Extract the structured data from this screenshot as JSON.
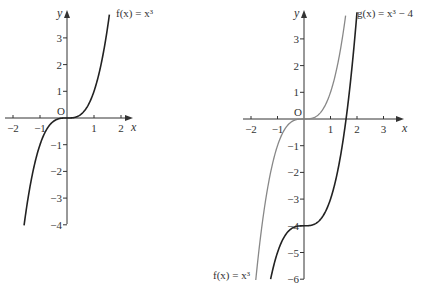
{
  "chart_data": [
    {
      "type": "line",
      "title": "",
      "xlabel": "x",
      "ylabel": "y",
      "origin_label": "O",
      "xlim": [
        -2.3,
        2.5
      ],
      "ylim": [
        -4,
        3.9
      ],
      "x_ticks": [
        -2,
        -1,
        1,
        2
      ],
      "y_ticks": [
        3,
        2,
        1,
        -1,
        -2,
        -3,
        -4
      ],
      "x_tick_labels": [
        "−2",
        "−1",
        "1",
        "2"
      ],
      "y_tick_labels": [
        "3",
        "2",
        "1",
        "−1",
        "−2",
        "−3",
        "−4"
      ],
      "series": [
        {
          "name": "f(x) = x³",
          "expression": "x^3",
          "x_range": [
            -1.59,
            1.57
          ],
          "color": "#222222"
        }
      ],
      "annotations": [
        {
          "text": "f(x) = x³",
          "at": "top of curve"
        }
      ]
    },
    {
      "type": "line",
      "title": "",
      "xlabel": "x",
      "ylabel": "y",
      "origin_label": "O",
      "xlim": [
        -2.3,
        3.7
      ],
      "ylim": [
        -6,
        3.9
      ],
      "x_ticks": [
        -2,
        -1,
        1,
        2,
        3
      ],
      "y_ticks": [
        3,
        2,
        1,
        -1,
        -2,
        -3,
        -4,
        -5,
        -6
      ],
      "x_tick_labels": [
        "−2",
        "−1",
        "1",
        "2",
        "3"
      ],
      "y_tick_labels": [
        "3",
        "2",
        "1",
        "−1",
        "−2",
        "−3",
        "−4",
        "−5",
        "−6"
      ],
      "series": [
        {
          "name": "f(x) = x³",
          "expression": "x^3",
          "x_range": [
            -1.82,
            1.57
          ],
          "color": "#888888"
        },
        {
          "name": "g(x) = x³ − 4",
          "expression": "x^3 - 4",
          "x_range": [
            -1.26,
            2.0
          ],
          "color": "#222222"
        }
      ],
      "annotations": [
        {
          "text": "g(x) = x³ − 4",
          "at": "top of g curve"
        },
        {
          "text": "f(x) = x³",
          "at": "bottom of f curve"
        }
      ]
    }
  ],
  "labels": {
    "x": "x",
    "y": "y",
    "origin": "O",
    "left_curve": "f(x) = x³",
    "right_g": "g(x) = x³ − 4",
    "right_f": "f(x) = x³"
  }
}
